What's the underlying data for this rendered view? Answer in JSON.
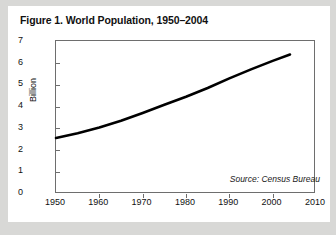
{
  "figure": {
    "title": "Figure 1. World Population, 1950–2004",
    "source_note": "Source: Census Bureau",
    "panel_background": "#ffffff",
    "page_background": "#d8d8d6",
    "frame_color": "#6e6e6e",
    "line_color": "#000000"
  },
  "chart_data": {
    "type": "line",
    "title": "Figure 1. World Population, 1950–2004",
    "xlabel": "",
    "ylabel": "Billion",
    "xlim": [
      1950,
      2010
    ],
    "ylim": [
      0,
      7
    ],
    "grid": false,
    "legend": null,
    "annotations": [
      "Source: Census Bureau"
    ],
    "xticks": [
      1950,
      1960,
      1970,
      1980,
      1990,
      2000,
      2010
    ],
    "xticklabels": [
      "1950",
      "1960",
      "1970",
      "1980",
      "1990",
      "2000",
      "2010"
    ],
    "yticks": [
      0,
      1,
      2,
      3,
      4,
      5,
      6,
      7
    ],
    "yticklabels": [
      "0",
      "1",
      "2",
      "3",
      "4",
      "5",
      "6",
      "7"
    ],
    "series": [
      {
        "name": "World Population",
        "units": "Billion",
        "x": [
          1950,
          1955,
          1960,
          1965,
          1970,
          1975,
          1980,
          1985,
          1990,
          1995,
          2000,
          2004
        ],
        "values": [
          2.56,
          2.78,
          3.04,
          3.35,
          3.71,
          4.08,
          4.45,
          4.85,
          5.29,
          5.7,
          6.09,
          6.38
        ]
      }
    ]
  }
}
